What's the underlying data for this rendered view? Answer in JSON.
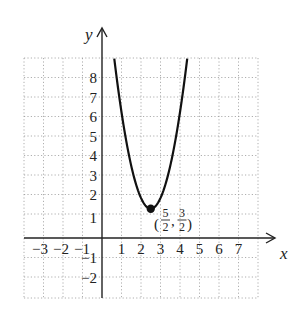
{
  "chart_data": {
    "type": "line",
    "title": "",
    "xlabel": "x",
    "ylabel": "y",
    "xlim": [
      -4,
      8
    ],
    "ylim": [
      -3,
      9
    ],
    "grid": true,
    "x_ticks": [
      "-3",
      "-2",
      "-1",
      "1",
      "2",
      "3",
      "4",
      "5",
      "6",
      "7"
    ],
    "y_ticks": [
      "-2",
      "-1",
      "1",
      "2",
      "3",
      "4",
      "5",
      "6",
      "7",
      "8"
    ],
    "series": [
      {
        "name": "parabola",
        "equation": "y = a(x - 5/2)^2 + 3/2",
        "vertex": [
          2.5,
          1.5
        ],
        "a": 2.2,
        "x": [
          0.63,
          1.0,
          1.5,
          2.0,
          2.5,
          3.0,
          3.5,
          4.0,
          4.37
        ],
        "y": [
          9.2,
          6.45,
          3.7,
          2.05,
          1.5,
          2.05,
          3.7,
          6.45,
          9.2
        ]
      }
    ],
    "annotations": [
      {
        "point": [
          2.5,
          1.5
        ],
        "label": "(5/2, 3/2)",
        "marker": "filled-dot"
      }
    ]
  },
  "labels": {
    "x_axis": "x",
    "y_axis": "y",
    "vertex_open": "(",
    "vertex_close": ")",
    "vertex_comma": ",",
    "vertex_x_num": "5",
    "vertex_x_den": "2",
    "vertex_y_num": "3",
    "vertex_y_den": "2",
    "xt_m3": "−3",
    "xt_m2": "−2",
    "xt_m1": "−1",
    "xt_1": "1",
    "xt_2": "2",
    "xt_3": "3",
    "xt_4": "4",
    "xt_5": "5",
    "xt_6": "6",
    "xt_7": "7",
    "yt_8": "8",
    "yt_7": "7",
    "yt_6": "6",
    "yt_5": "5",
    "yt_4": "4",
    "yt_3": "3",
    "yt_2": "2",
    "yt_1": "1",
    "yt_m1": "−1",
    "yt_m2": "−2"
  }
}
